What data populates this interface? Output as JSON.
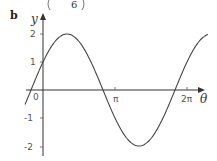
{
  "header": {
    "fragment": "6",
    "part_label": "b"
  },
  "chart_data": {
    "type": "line",
    "title": "",
    "function": "y = 2 sin(θ + π/6)",
    "xlabel": "θ",
    "ylabel": "y",
    "x_ticks": [
      {
        "value": 0,
        "label": "0"
      },
      {
        "value": 3.14159,
        "label": "π"
      },
      {
        "value": 6.28319,
        "label": "2π"
      }
    ],
    "y_ticks": [
      {
        "value": 2,
        "label": "2"
      },
      {
        "value": 1,
        "label": "1"
      },
      {
        "value": -1,
        "label": "-1"
      },
      {
        "value": -2,
        "label": "-2"
      }
    ],
    "xlim": [
      -0.7,
      7.0
    ],
    "ylim": [
      -2.4,
      2.5
    ],
    "grid": false,
    "series": [
      {
        "name": "y = 2sin(θ + π/6)",
        "x": [
          -0.5236,
          0,
          1.0472,
          2.618,
          4.1888,
          5.7596,
          6.8068
        ],
        "values": [
          0,
          1,
          2,
          0,
          -2,
          0,
          2
        ]
      }
    ],
    "key_points": {
      "y_intercept": 1,
      "max": {
        "x": 1.0472,
        "y": 2
      },
      "min": {
        "x": 4.1888,
        "y": -2
      },
      "zeros": [
        -0.5236,
        2.618,
        5.7596
      ]
    }
  }
}
